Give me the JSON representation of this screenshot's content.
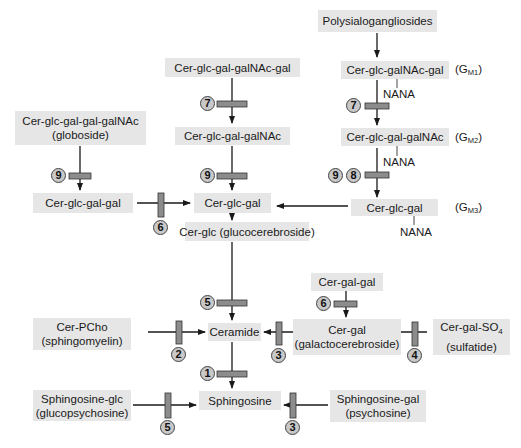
{
  "diagram": {
    "colors": {
      "box_fill": "#e6e6e6",
      "block_bar": "#8c8c8c",
      "badge_fill": "#c8c8c8",
      "line": "#1a1a1a"
    },
    "nodes": {
      "polysialo": {
        "line1": "Polysialogangliosides"
      },
      "gm1": {
        "line1": "Cer-glc-galNAc-gal",
        "substituent": "NANA",
        "g_name": "G",
        "g_sub": "M1"
      },
      "gm2": {
        "line1": "Cer-glc-gal-galNAc",
        "substituent": "NANA",
        "g_name": "G",
        "g_sub": "M2"
      },
      "gm3": {
        "line1": "Cer-glc-gal",
        "substituent": "NANA",
        "g_name": "G",
        "g_sub": "M3"
      },
      "asialo_gm1": {
        "line1": "Cer-glc-gal-galNAc-gal"
      },
      "asialo_gm2": {
        "line1": "Cer-glc-gal-galNAc"
      },
      "lactosyl": {
        "line1": "Cer-glc-gal"
      },
      "globoside": {
        "line1": "Cer-glc-gal-gal-galNAc",
        "line2": "(globoside)"
      },
      "trihexosyl": {
        "line1": "Cer-glc-gal-gal"
      },
      "glucocerebroside": {
        "line1": "Cer-glc (glucocerebroside)"
      },
      "digalactosyl": {
        "line1": "Cer-gal-gal"
      },
      "sphingomyelin": {
        "line1": "Cer-PCho",
        "line2": "(sphingomyelin)"
      },
      "ceramide": {
        "line1": "Ceramide"
      },
      "galactocerebroside": {
        "line1": "Cer-gal",
        "line2": "(galactocerebroside)"
      },
      "sulfatide": {
        "line1": "Cer-gal-SO",
        "sub": "4",
        "line2": "(sulfatide)"
      },
      "sphingosine": {
        "line1": "Sphingosine"
      },
      "glucopsychosine": {
        "line1": "Sphingosine-glc",
        "line2": "(glucopsychosine)"
      },
      "psychosine": {
        "line1": "Sphingosine-gal",
        "line2": "(psychosine)"
      }
    },
    "enzyme_blocks": [
      {
        "id": "gm1-to-gm2",
        "badges": [
          "7"
        ]
      },
      {
        "id": "asialo-gm1-to-asialo-gm2",
        "badges": [
          "7"
        ]
      },
      {
        "id": "gm2-to-gm3",
        "badges": [
          "9",
          "8"
        ]
      },
      {
        "id": "asialo-gm2-to-lactosyl",
        "badges": [
          "9"
        ]
      },
      {
        "id": "globoside-to-trihexosyl",
        "badges": [
          "9"
        ]
      },
      {
        "id": "trihexosyl-to-lactosyl",
        "badges": [
          "6"
        ]
      },
      {
        "id": "glucocerebroside-to-ceramide",
        "badges": [
          "5"
        ]
      },
      {
        "id": "digalactosyl-to-galactocerebroside",
        "badges": [
          "6"
        ]
      },
      {
        "id": "sphingomyelin-to-ceramide",
        "badges": [
          "2"
        ]
      },
      {
        "id": "galactocerebroside-to-ceramide",
        "badges": [
          "3"
        ]
      },
      {
        "id": "sulfatide-to-galactocerebroside",
        "badges": [
          "4"
        ]
      },
      {
        "id": "ceramide-to-sphingosine",
        "badges": [
          "1"
        ]
      },
      {
        "id": "glucopsychosine-to-sphingosine",
        "badges": [
          "5"
        ]
      },
      {
        "id": "psychosine-to-sphingosine",
        "badges": [
          "3"
        ]
      }
    ]
  }
}
